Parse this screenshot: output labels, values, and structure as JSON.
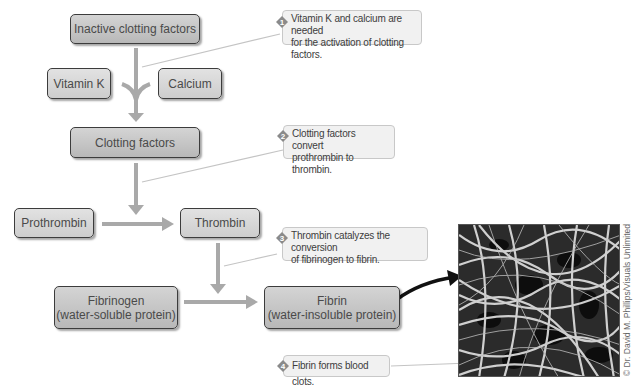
{
  "boxes": {
    "inactive": "Inactive clotting factors",
    "vitamin_k": "Vitamin K",
    "calcium": "Calcium",
    "clotting_factors": "Clotting factors",
    "prothrombin": "Prothrombin",
    "thrombin": "Thrombin",
    "fibrinogen_title": "Fibrinogen",
    "fibrinogen_sub": "(water-soluble protein)",
    "fibrin_title": "Fibrin",
    "fibrin_sub": "(water-insoluble protein)"
  },
  "notes": [
    {
      "num": "1",
      "line1": "Vitamin K and calcium are needed",
      "line2": "for the activation of clotting factors."
    },
    {
      "num": "2",
      "line1": "Clotting factors convert",
      "line2": "prothrombin to thrombin."
    },
    {
      "num": "3",
      "line1": "Thrombin catalyzes the conversion",
      "line2": "of fibrinogen to fibrin."
    },
    {
      "num": "4",
      "line1": "Fibrin forms blood clots."
    }
  ],
  "photo": {
    "credit": "© Dr. David M. Phillips/Visuals Unlimited"
  },
  "colors": {
    "arrow": "#a9a9a9",
    "box_fill": "#c6c6c6",
    "box_border": "#3c3c3c",
    "note_fill": "#f1f1f1",
    "badge": "#8a8a8a"
  }
}
